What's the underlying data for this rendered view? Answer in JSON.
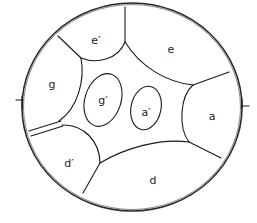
{
  "diagram": {
    "type": "region-partition",
    "outer_shape": "circle",
    "regions": [
      {
        "id": "e_prime",
        "label": "e′",
        "x": 96,
        "y": 41
      },
      {
        "id": "e",
        "label": "e",
        "x": 171,
        "y": 50
      },
      {
        "id": "g",
        "label": "g",
        "x": 52,
        "y": 85
      },
      {
        "id": "g_prime",
        "label": "g′",
        "x": 103,
        "y": 101
      },
      {
        "id": "a_prime",
        "label": "a′",
        "x": 146,
        "y": 113
      },
      {
        "id": "a",
        "label": "a",
        "x": 212,
        "y": 117
      },
      {
        "id": "d_prime",
        "label": "d′",
        "x": 69,
        "y": 164
      },
      {
        "id": "d",
        "label": "d",
        "x": 153,
        "y": 181
      }
    ],
    "tick_marks": [
      {
        "side": "left",
        "x": 22,
        "y": 103
      },
      {
        "side": "right",
        "x": 242,
        "y": 106
      }
    ]
  }
}
